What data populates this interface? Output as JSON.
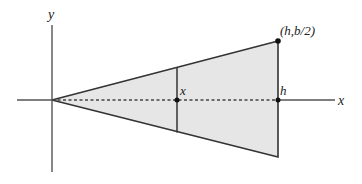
{
  "diagram": {
    "labels": {
      "y_axis": "y",
      "x_axis": "x",
      "slice_position": "x",
      "height_point": "h",
      "apex_point": "(h,b/2)"
    },
    "colors": {
      "fill": "#e6e6e6",
      "stroke": "#333333",
      "dashed": "#444444",
      "background": "#ffffff"
    },
    "geometry": {
      "origin": [
        52,
        100
      ],
      "top_vertex": [
        278,
        41
      ],
      "bottom_vertex": [
        278,
        157
      ],
      "slice_x": 177,
      "y_axis_range": [
        25,
        172
      ],
      "x_axis_range": [
        17,
        335
      ]
    }
  }
}
